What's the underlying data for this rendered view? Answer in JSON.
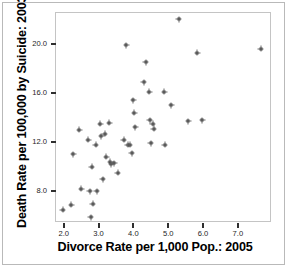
{
  "chart_data": {
    "type": "scatter",
    "title": "",
    "xlabel": "Divorce Rate per 1,000 Pop.: 2005",
    "ylabel": "Death Rate per 100,000 by Suicide: 2003",
    "xlim": [
      1.75,
      7.95
    ],
    "ylim": [
      5.5,
      22.6
    ],
    "xticks": [
      "2.0",
      "3.0",
      "4.0",
      "5.0",
      "6.0",
      "7.0"
    ],
    "xtick_values": [
      2.0,
      3.0,
      4.0,
      5.0,
      6.0,
      7.0
    ],
    "yticks": [
      "8.0",
      "12.0",
      "16.0",
      "20.0"
    ],
    "ytick_values": [
      8.0,
      12.0,
      16.0,
      20.0
    ],
    "grid": false,
    "legend": null,
    "marker": "plus-dot",
    "marker_color": "#2b2b2b",
    "frame_color": "#c4c4c4",
    "background": "#ffffff",
    "points": [
      {
        "x": 1.97,
        "y": 6.5
      },
      {
        "x": 2.22,
        "y": 6.9
      },
      {
        "x": 2.28,
        "y": 11.0
      },
      {
        "x": 2.45,
        "y": 13.0
      },
      {
        "x": 2.5,
        "y": 8.2
      },
      {
        "x": 2.7,
        "y": 12.2
      },
      {
        "x": 2.75,
        "y": 8.0
      },
      {
        "x": 2.78,
        "y": 5.9
      },
      {
        "x": 2.8,
        "y": 10.0
      },
      {
        "x": 2.83,
        "y": 7.0
      },
      {
        "x": 2.92,
        "y": 11.8
      },
      {
        "x": 2.95,
        "y": 8.0
      },
      {
        "x": 3.05,
        "y": 13.5
      },
      {
        "x": 3.08,
        "y": 12.5
      },
      {
        "x": 3.12,
        "y": 9.0
      },
      {
        "x": 3.18,
        "y": 12.7
      },
      {
        "x": 3.22,
        "y": 10.8
      },
      {
        "x": 3.3,
        "y": 13.6
      },
      {
        "x": 3.33,
        "y": 10.4
      },
      {
        "x": 3.36,
        "y": 10.2
      },
      {
        "x": 3.45,
        "y": 10.3
      },
      {
        "x": 3.55,
        "y": 9.5
      },
      {
        "x": 3.72,
        "y": 12.2
      },
      {
        "x": 3.8,
        "y": 19.9
      },
      {
        "x": 3.84,
        "y": 11.8
      },
      {
        "x": 3.9,
        "y": 11.8
      },
      {
        "x": 3.95,
        "y": 11.1
      },
      {
        "x": 4.0,
        "y": 15.4
      },
      {
        "x": 4.02,
        "y": 14.4
      },
      {
        "x": 4.05,
        "y": 13.2
      },
      {
        "x": 4.3,
        "y": 16.9
      },
      {
        "x": 4.35,
        "y": 18.5
      },
      {
        "x": 4.45,
        "y": 16.1
      },
      {
        "x": 4.47,
        "y": 13.8
      },
      {
        "x": 4.5,
        "y": 11.9
      },
      {
        "x": 4.55,
        "y": 13.5
      },
      {
        "x": 4.58,
        "y": 13.1
      },
      {
        "x": 4.88,
        "y": 16.1
      },
      {
        "x": 4.9,
        "y": 11.8
      },
      {
        "x": 5.08,
        "y": 15.0
      },
      {
        "x": 5.3,
        "y": 22.0
      },
      {
        "x": 5.58,
        "y": 13.7
      },
      {
        "x": 5.83,
        "y": 19.3
      },
      {
        "x": 5.97,
        "y": 13.8
      },
      {
        "x": 7.65,
        "y": 19.6
      }
    ]
  },
  "figure": {
    "xlabel": "Divorce Rate per 1,000 Pop.: 2005",
    "ylabel": "Death Rate per 100,000 by Suicide: 2003"
  }
}
